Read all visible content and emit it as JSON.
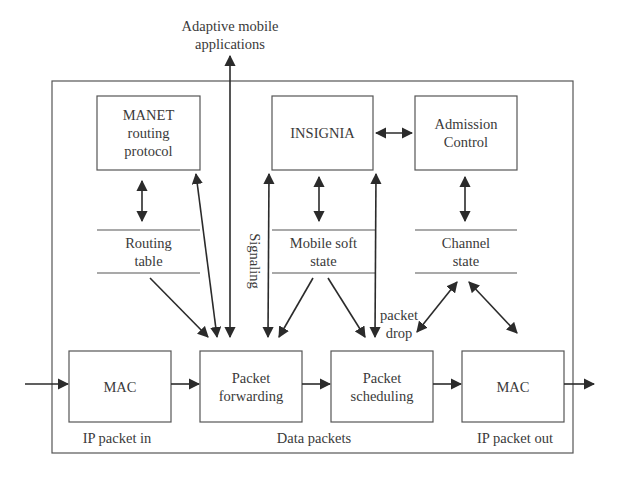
{
  "diagram": {
    "colors": {
      "line": "#2b2b2b",
      "box_border": "#555555",
      "text": "#3a3a3a",
      "background": "#ffffff"
    },
    "top_label": {
      "line1": "Adaptive mobile",
      "line2": "applications"
    },
    "boxes": {
      "manet": {
        "line1": "MANET",
        "line2": "routing",
        "line3": "protocol"
      },
      "insignia": {
        "line1": "INSIGNIA"
      },
      "admission": {
        "line1": "Admission",
        "line2": "Control"
      },
      "mac_in": {
        "line1": "MAC"
      },
      "forwarding": {
        "line1": "Packet",
        "line2": "forwarding"
      },
      "scheduling": {
        "line1": "Packet",
        "line2": "scheduling"
      },
      "mac_out": {
        "line1": "MAC"
      }
    },
    "state_tables": {
      "routing": {
        "line1": "Routing",
        "line2": "table"
      },
      "mobile_soft": {
        "line1": "Mobile soft",
        "line2": "state"
      },
      "channel": {
        "line1": "Channel",
        "line2": "state"
      }
    },
    "edge_labels": {
      "signaling": "Signaling",
      "packet_drop_1": "packet",
      "packet_drop_2": "drop",
      "ip_in": "IP packet in",
      "data_packets": "Data packets",
      "ip_out": "IP packet out"
    }
  }
}
